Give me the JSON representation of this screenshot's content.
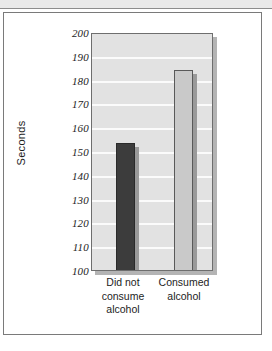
{
  "figure": {
    "background_color": "#ffffff",
    "frame_border_color": "#7a7a7a",
    "top_band_color": "#e9e9e9"
  },
  "chart_data": {
    "type": "bar",
    "title": "",
    "xlabel": "",
    "ylabel": "Seconds",
    "categories": [
      "Did not consume alcohol",
      "Consumed alcohol"
    ],
    "category_label_lines": [
      [
        "Did not",
        "consume",
        "alcohol"
      ],
      [
        "Consumed",
        "alcohol"
      ]
    ],
    "values": [
      154,
      185
    ],
    "ylim": [
      100,
      200
    ],
    "ytick_step": 10,
    "yticks": [
      200,
      190,
      180,
      170,
      160,
      150,
      140,
      130,
      120,
      110,
      100
    ],
    "ytick_labels": [
      "200",
      "190",
      "180",
      "170",
      "160",
      "150",
      "140",
      "130",
      "120",
      "110",
      "100"
    ],
    "grid": true,
    "gridline_color": "#fbfbfb",
    "plot_background": "#e2e2e2",
    "legend": null,
    "legend_position": "none",
    "bar_colors": [
      "#3c3c3c",
      "#c9c9c9"
    ],
    "bar_edge_colors": [
      "#2a2a2a",
      "#595959"
    ],
    "annotations": []
  }
}
